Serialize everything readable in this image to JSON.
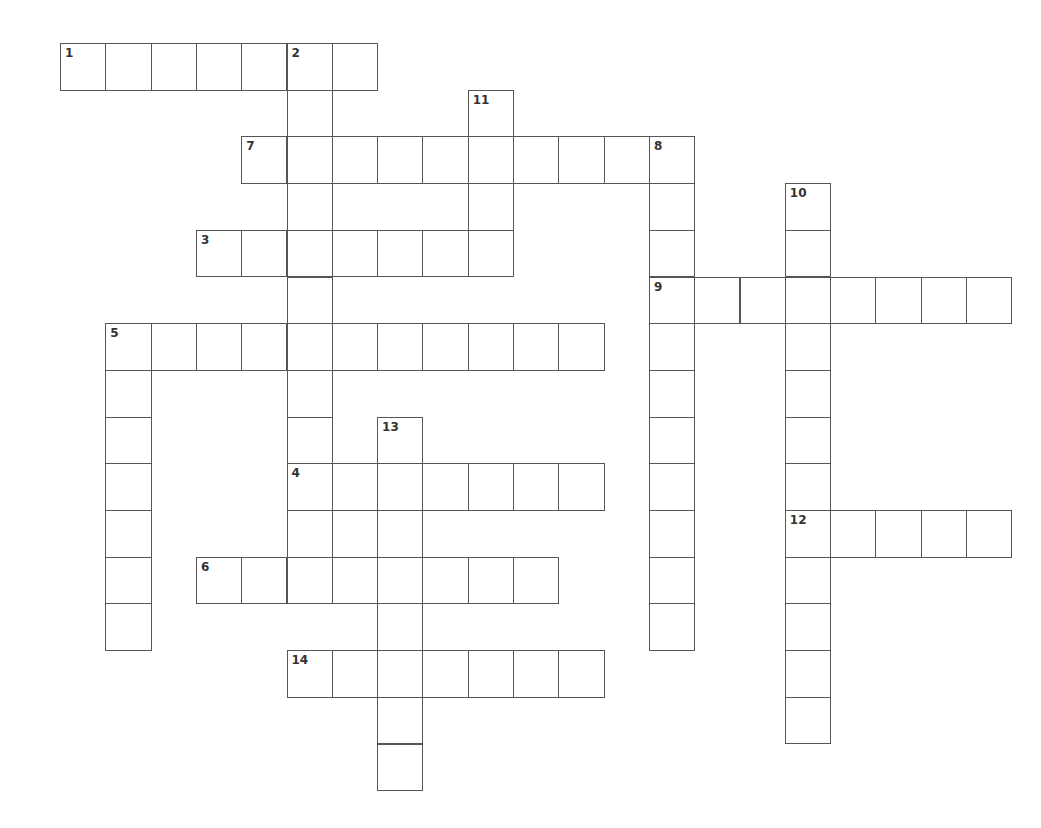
{
  "puzzle": {
    "grid_origin": {
      "x": 60,
      "y": 43
    },
    "cell_w": 45.3,
    "cell_h": 46.7,
    "line_color": "#555555",
    "words": [
      {
        "number": "1",
        "dir": "across",
        "row": 0,
        "col": 0,
        "length": 7
      },
      {
        "number": "2",
        "dir": "down",
        "row": 0,
        "col": 5,
        "length": 12
      },
      {
        "number": "11",
        "dir": "down",
        "row": 1,
        "col": 9,
        "length": 4
      },
      {
        "number": "7",
        "dir": "across",
        "row": 2,
        "col": 4,
        "length": 10
      },
      {
        "number": "8",
        "dir": "down",
        "row": 2,
        "col": 13,
        "length": 11
      },
      {
        "number": "10",
        "dir": "down",
        "row": 3,
        "col": 16,
        "length": 12
      },
      {
        "number": "3",
        "dir": "across",
        "row": 4,
        "col": 3,
        "length": 6
      },
      {
        "number": "9",
        "dir": "across",
        "row": 5,
        "col": 13,
        "length": 8
      },
      {
        "number": "5",
        "dir": "across",
        "row": 6,
        "col": 1,
        "length": 11
      },
      {
        "number": "",
        "dir": "down",
        "row": 6,
        "col": 1,
        "length": 7
      },
      {
        "number": "13",
        "dir": "down",
        "row": 8,
        "col": 7,
        "length": 8
      },
      {
        "number": "4",
        "dir": "across",
        "row": 9,
        "col": 5,
        "length": 7
      },
      {
        "number": "",
        "dir": "down",
        "row": 9,
        "col": 6,
        "length": 3
      },
      {
        "number": "12",
        "dir": "across",
        "row": 10,
        "col": 16,
        "length": 5
      },
      {
        "number": "6",
        "dir": "across",
        "row": 11,
        "col": 3,
        "length": 8
      },
      {
        "number": "14",
        "dir": "across",
        "row": 13,
        "col": 5,
        "length": 7
      }
    ]
  }
}
